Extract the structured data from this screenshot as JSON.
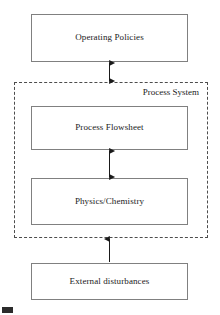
{
  "diagram": {
    "title": "Process System",
    "type": "block-diagram",
    "colors": {
      "box_border": "#808080",
      "dashed_border": "#4d4d4d",
      "text": "#1a1a1a",
      "arrow": "#1a1a1a",
      "background": "#ffffff"
    },
    "boxes": [
      {
        "id": "operating-policies",
        "label": "Operating Policies",
        "inside_process_system": false
      },
      {
        "id": "process-flowsheet",
        "label": "Process Flowsheet",
        "inside_process_system": true
      },
      {
        "id": "physics-chemistry",
        "label": "Physics/Chemistry",
        "inside_process_system": true
      },
      {
        "id": "external-disturbances",
        "label": "External disturbances",
        "inside_process_system": false
      }
    ],
    "group": {
      "id": "process-system",
      "label": "Process System",
      "style": "dashed",
      "label_position": "top-right",
      "contains": [
        "process-flowsheet",
        "physics-chemistry"
      ]
    },
    "connectors": [
      {
        "id": "operating-policies-to-process-system",
        "from": "operating-policies",
        "to": "process-system",
        "arrowheads": "both",
        "direction": "vertical"
      },
      {
        "id": "process-flowsheet-to-physics-chemistry",
        "from": "process-flowsheet",
        "to": "physics-chemistry",
        "arrowheads": "both",
        "direction": "vertical"
      },
      {
        "id": "external-disturbances-to-process-system",
        "from": "external-disturbances",
        "to": "process-system",
        "arrowheads": "end",
        "direction": "vertical-up"
      }
    ]
  }
}
